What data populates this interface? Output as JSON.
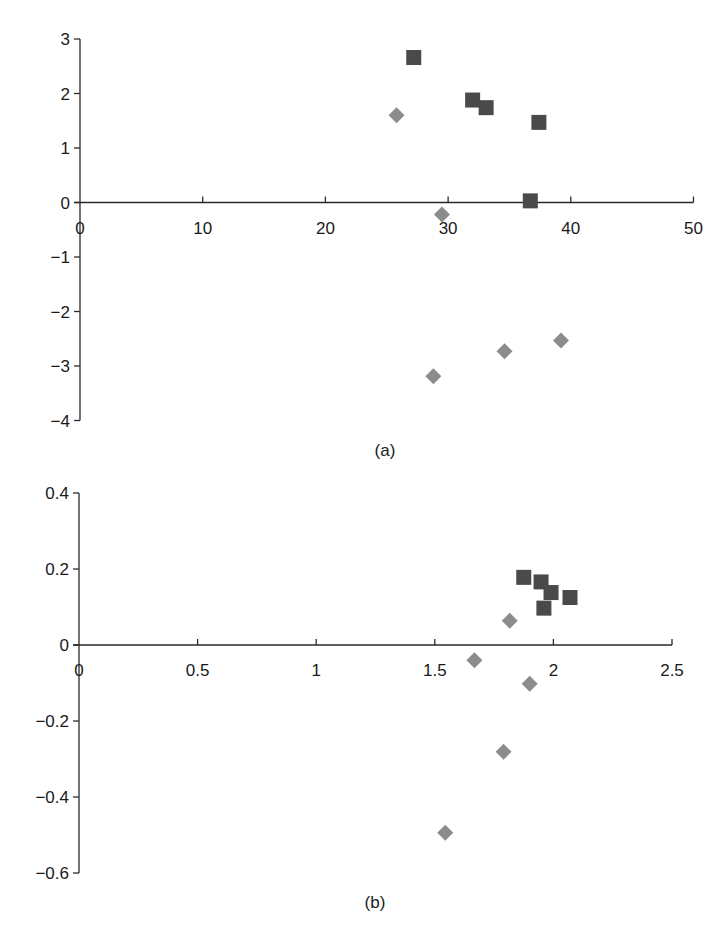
{
  "chart_data": [
    {
      "type": "scatter",
      "title": "",
      "caption": "(a)",
      "xlabel": "",
      "ylabel": "",
      "xlim": [
        0,
        50
      ],
      "ylim": [
        -4,
        3
      ],
      "x_ticks": [
        0,
        10,
        20,
        30,
        40,
        50
      ],
      "x_tick_labels": [
        "0",
        "10",
        "20",
        "30",
        "40",
        "50"
      ],
      "y_ticks": [
        3,
        2,
        1,
        0,
        -1,
        -2,
        -3,
        -4
      ],
      "y_tick_labels": [
        "3",
        "2",
        "1",
        "0",
        "−1",
        "−2",
        "−3",
        "−4"
      ],
      "grid": false,
      "legend": null,
      "series": [
        {
          "name": "squares",
          "marker": "square",
          "color": "#4a4a4a",
          "points": [
            {
              "x": 27.2,
              "y": 2.66
            },
            {
              "x": 32.0,
              "y": 1.88
            },
            {
              "x": 33.1,
              "y": 1.74
            },
            {
              "x": 37.4,
              "y": 1.47
            },
            {
              "x": 36.7,
              "y": 0.03
            }
          ]
        },
        {
          "name": "diamonds",
          "marker": "diamond",
          "color": "#8c8c8c",
          "points": [
            {
              "x": 25.8,
              "y": 1.6
            },
            {
              "x": 29.5,
              "y": -0.22
            },
            {
              "x": 28.8,
              "y": -3.19
            },
            {
              "x": 34.6,
              "y": -2.73
            },
            {
              "x": 39.2,
              "y": -2.53
            }
          ]
        }
      ]
    },
    {
      "type": "scatter",
      "title": "",
      "caption": "(b)",
      "xlabel": "",
      "ylabel": "",
      "xlim": [
        0,
        2.5
      ],
      "ylim": [
        -0.6,
        0.4
      ],
      "x_ticks": [
        0,
        0.5,
        1,
        1.5,
        2,
        2.5
      ],
      "x_tick_labels": [
        "0",
        "0.5",
        "1",
        "1.5",
        "2",
        "2.5"
      ],
      "y_ticks": [
        0.4,
        0.2,
        0,
        -0.2,
        -0.4,
        -0.6
      ],
      "y_tick_labels": [
        "0.4",
        "0.2",
        "0",
        "−0.2",
        "−0.4",
        "−0.6"
      ],
      "grid": false,
      "legend": null,
      "series": [
        {
          "name": "squares",
          "marker": "square",
          "color": "#4a4a4a",
          "points": [
            {
              "x": 1.875,
              "y": 0.178
            },
            {
              "x": 1.948,
              "y": 0.166
            },
            {
              "x": 1.99,
              "y": 0.138
            },
            {
              "x": 1.96,
              "y": 0.097
            },
            {
              "x": 2.07,
              "y": 0.125
            }
          ]
        },
        {
          "name": "diamonds",
          "marker": "diamond",
          "color": "#8c8c8c",
          "points": [
            {
              "x": 1.816,
              "y": 0.064
            },
            {
              "x": 1.667,
              "y": -0.04
            },
            {
              "x": 1.9,
              "y": -0.102
            },
            {
              "x": 1.79,
              "y": -0.281
            },
            {
              "x": 1.544,
              "y": -0.494
            }
          ]
        }
      ]
    }
  ]
}
